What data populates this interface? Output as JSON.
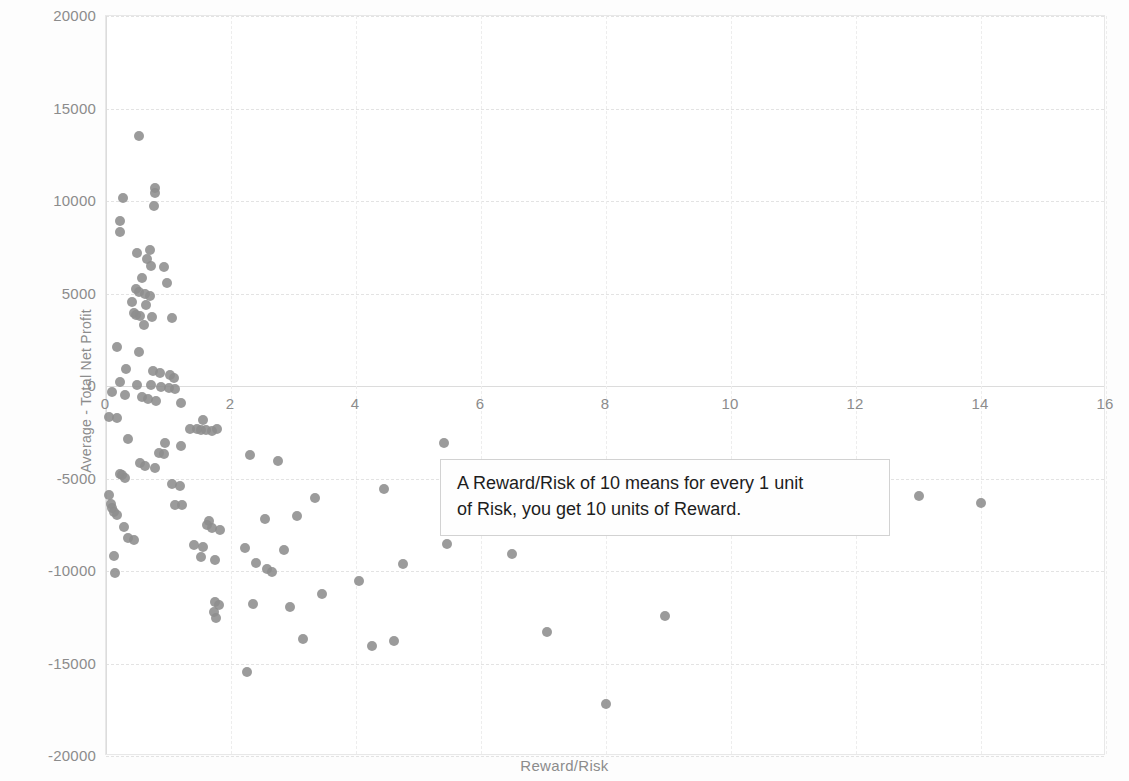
{
  "chart_data": {
    "type": "scatter",
    "title": "",
    "xlabel": "Reward/Risk",
    "ylabel": "Average - Total Net Profit",
    "xlim": [
      0,
      16
    ],
    "ylim": [
      -20000,
      20000
    ],
    "xticks": [
      0,
      2,
      4,
      6,
      8,
      10,
      12,
      14,
      16
    ],
    "yticks": [
      20000,
      15000,
      10000,
      5000,
      0,
      -5000,
      -10000,
      -15000,
      -20000
    ],
    "xtick_labels": [
      "0",
      "2",
      "4",
      "6",
      "8",
      "10",
      "12",
      "14",
      "16"
    ],
    "ytick_labels": [
      "20000",
      "15000",
      "10000",
      "5000",
      "0",
      "-5000",
      "-10000",
      "-15000",
      "-20000"
    ],
    "grid": true,
    "legend": null,
    "marker_color": "#8d8d8d",
    "marker_shape": "circle",
    "series": [
      {
        "name": "Strategies",
        "points": [
          [
            0.52,
            13500
          ],
          [
            0.27,
            10150
          ],
          [
            0.78,
            10700
          ],
          [
            0.79,
            10450
          ],
          [
            0.76,
            9750
          ],
          [
            0.23,
            8900
          ],
          [
            0.22,
            8350
          ],
          [
            0.5,
            7200
          ],
          [
            0.7,
            7350
          ],
          [
            0.66,
            6850
          ],
          [
            0.72,
            6500
          ],
          [
            0.93,
            6450
          ],
          [
            0.58,
            5850
          ],
          [
            0.97,
            5550
          ],
          [
            0.48,
            5250
          ],
          [
            0.52,
            5100
          ],
          [
            0.62,
            4950
          ],
          [
            0.7,
            4850
          ],
          [
            0.41,
            4550
          ],
          [
            0.64,
            4400
          ],
          [
            0.44,
            3950
          ],
          [
            0.48,
            3850
          ],
          [
            0.55,
            3800
          ],
          [
            0.74,
            3750
          ],
          [
            1.05,
            3700
          ],
          [
            0.6,
            3300
          ],
          [
            0.17,
            2100
          ],
          [
            0.52,
            1850
          ],
          [
            0.32,
            900
          ],
          [
            0.75,
            800
          ],
          [
            0.87,
            700
          ],
          [
            1.02,
            600
          ],
          [
            1.08,
            450
          ],
          [
            0.22,
            200
          ],
          [
            0.5,
            80
          ],
          [
            0.72,
            50
          ],
          [
            0.88,
            -60
          ],
          [
            1.0,
            -100
          ],
          [
            1.1,
            -150
          ],
          [
            0.1,
            -350
          ],
          [
            0.3,
            -500
          ],
          [
            0.58,
            -600
          ],
          [
            0.67,
            -700
          ],
          [
            0.8,
            -800
          ],
          [
            1.2,
            -900
          ],
          [
            0.05,
            -1700
          ],
          [
            0.17,
            -1750
          ],
          [
            1.55,
            -1850
          ],
          [
            1.35,
            -2300
          ],
          [
            1.45,
            -2350
          ],
          [
            1.52,
            -2400
          ],
          [
            1.6,
            -2400
          ],
          [
            1.7,
            -2420
          ],
          [
            1.78,
            -2350
          ],
          [
            0.35,
            -2850
          ],
          [
            0.95,
            -3100
          ],
          [
            1.2,
            -3250
          ],
          [
            0.85,
            -3600
          ],
          [
            0.92,
            -3650
          ],
          [
            2.3,
            -3750
          ],
          [
            2.75,
            -4050
          ],
          [
            0.55,
            -4150
          ],
          [
            0.62,
            -4300
          ],
          [
            0.78,
            -4450
          ],
          [
            0.22,
            -4750
          ],
          [
            0.26,
            -4800
          ],
          [
            0.3,
            -4950
          ],
          [
            1.05,
            -5300
          ],
          [
            1.18,
            -5400
          ],
          [
            0.05,
            -5900
          ],
          [
            0.08,
            -6400
          ],
          [
            0.1,
            -6600
          ],
          [
            0.13,
            -6800
          ],
          [
            0.17,
            -6950
          ],
          [
            1.1,
            -6450
          ],
          [
            1.22,
            -6450
          ],
          [
            3.35,
            -6050
          ],
          [
            4.45,
            -5550
          ],
          [
            13.0,
            -5950
          ],
          [
            14.0,
            -6350
          ],
          [
            2.55,
            -7200
          ],
          [
            3.05,
            -7000
          ],
          [
            1.65,
            -7300
          ],
          [
            1.62,
            -7500
          ],
          [
            0.28,
            -7600
          ],
          [
            1.7,
            -7700
          ],
          [
            1.82,
            -7800
          ],
          [
            0.35,
            -8200
          ],
          [
            0.45,
            -8350
          ],
          [
            1.4,
            -8600
          ],
          [
            1.55,
            -8700
          ],
          [
            2.22,
            -8750
          ],
          [
            2.85,
            -8850
          ],
          [
            5.45,
            -8550
          ],
          [
            6.5,
            -9100
          ],
          [
            1.52,
            -9250
          ],
          [
            1.75,
            -9400
          ],
          [
            2.4,
            -9550
          ],
          [
            2.58,
            -9900
          ],
          [
            2.65,
            -10050
          ],
          [
            4.75,
            -9600
          ],
          [
            0.12,
            -9200
          ],
          [
            0.14,
            -10100
          ],
          [
            1.75,
            -11700
          ],
          [
            1.72,
            -12200
          ],
          [
            1.8,
            -11850
          ],
          [
            1.76,
            -12550
          ],
          [
            2.35,
            -11800
          ],
          [
            2.95,
            -11950
          ],
          [
            3.45,
            -11250
          ],
          [
            4.05,
            -10550
          ],
          [
            8.95,
            -12450
          ],
          [
            7.05,
            -13300
          ],
          [
            3.15,
            -13650
          ],
          [
            4.25,
            -14050
          ],
          [
            4.6,
            -13800
          ],
          [
            2.25,
            -15450
          ],
          [
            8.0,
            -17200
          ],
          [
            5.4,
            -3100
          ]
        ]
      }
    ],
    "annotation": {
      "lines": [
        "A Reward/Risk of 10 means for every 1 unit",
        "of Risk, you get 10 units of Reward."
      ]
    }
  }
}
